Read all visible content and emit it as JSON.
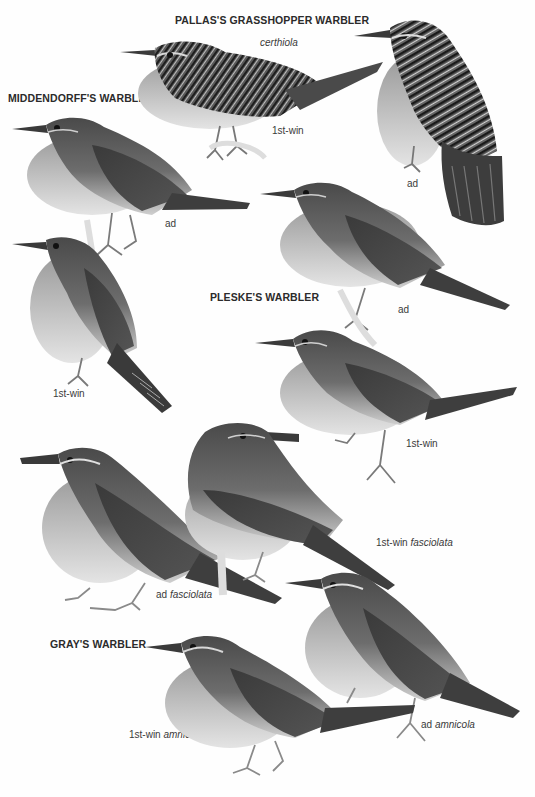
{
  "plate": {
    "species": [
      {
        "title": "PALLAS'S GRASSHOPPER WARBLER",
        "subspecies_heading": "certhiola",
        "figures": [
          {
            "age": "1st-win",
            "subspecies": ""
          },
          {
            "age": "ad",
            "subspecies": ""
          }
        ]
      },
      {
        "title": "MIDDENDORFF'S WARBLER",
        "figures": [
          {
            "age": "ad",
            "subspecies": ""
          },
          {
            "age": "1st-win",
            "subspecies": ""
          }
        ]
      },
      {
        "title": "PLESKE'S WARBLER",
        "figures": [
          {
            "age": "ad",
            "subspecies": ""
          },
          {
            "age": "1st-win",
            "subspecies": ""
          }
        ]
      },
      {
        "title": "GRAY'S WARBLER",
        "figures": [
          {
            "age": "ad",
            "subspecies": "fasciolata"
          },
          {
            "age": "1st-win",
            "subspecies": "fasciolata"
          },
          {
            "age": "1st-win",
            "subspecies": "amnicola"
          },
          {
            "age": "ad",
            "subspecies": "amnicola"
          }
        ]
      }
    ]
  },
  "colors": {
    "background": "#fefefe",
    "dark_plumage": "#3d3d3d",
    "mid_plumage": "#6e6e6e",
    "light_underparts": "#d8d8d8",
    "text": "#2b2b2b"
  }
}
